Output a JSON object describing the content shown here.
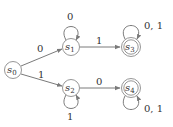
{
  "diagram": {
    "type": "finite-state-automaton",
    "colors": {
      "stroke": "#8a8a8a",
      "text": "#333333",
      "background": "#ffffff"
    },
    "states": [
      {
        "id": "s0",
        "base": "s",
        "sub": "0",
        "accepting": false,
        "start": true
      },
      {
        "id": "s1",
        "base": "s",
        "sub": "1",
        "accepting": false
      },
      {
        "id": "s2",
        "base": "s",
        "sub": "2",
        "accepting": false
      },
      {
        "id": "s3",
        "base": "s",
        "sub": "3",
        "accepting": true
      },
      {
        "id": "s4",
        "base": "s",
        "sub": "4",
        "accepting": true
      }
    ],
    "transitions": [
      {
        "from": "s0",
        "to": "s1",
        "label": "0"
      },
      {
        "from": "s0",
        "to": "s2",
        "label": "1"
      },
      {
        "from": "s1",
        "to": "s1",
        "label": "0"
      },
      {
        "from": "s1",
        "to": "s3",
        "label": "1"
      },
      {
        "from": "s2",
        "to": "s2",
        "label": "1"
      },
      {
        "from": "s2",
        "to": "s4",
        "label": "0"
      },
      {
        "from": "s3",
        "to": "s3",
        "label": "0, 1"
      },
      {
        "from": "s4",
        "to": "s4",
        "label": "0, 1"
      }
    ]
  }
}
